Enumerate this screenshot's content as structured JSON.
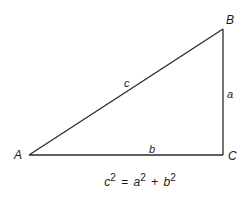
{
  "diagram": {
    "vertices": {
      "A": {
        "label": "A",
        "x": 29,
        "y": 155
      },
      "B": {
        "label": "B",
        "x": 223,
        "y": 29
      },
      "C": {
        "label": "C",
        "x": 223,
        "y": 155
      }
    },
    "sides": {
      "hypotenuse": {
        "label": "c",
        "from": "A",
        "to": "B"
      },
      "vertical": {
        "label": "a",
        "from": "B",
        "to": "C"
      },
      "horizontal": {
        "label": "b",
        "from": "A",
        "to": "C"
      }
    },
    "equation": {
      "lhs_var": "c",
      "lhs_exp": "2",
      "equals": "=",
      "term1_var": "a",
      "term1_exp": "2",
      "plus": "+",
      "term2_var": "b",
      "term2_exp": "2"
    },
    "colors": {
      "line": "#2a2a2a",
      "text": "#1a1a1a",
      "background": "#ffffff"
    }
  }
}
